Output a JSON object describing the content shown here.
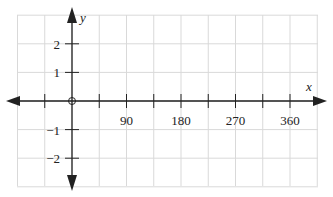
{
  "chart_data": {
    "type": "line",
    "title": "",
    "xlabel": "x",
    "ylabel": "y",
    "xlim": [
      -60,
      405
    ],
    "ylim": [
      -3,
      3
    ],
    "x_ticks": [
      90,
      180,
      270,
      360
    ],
    "x_tick_labels": [
      "90",
      "180",
      "270",
      "360"
    ],
    "y_ticks": [
      2,
      1,
      -1,
      -2
    ],
    "y_tick_labels": [
      "2",
      "1",
      "−1",
      "−2"
    ],
    "grid": true,
    "origin_marker": "open-circle",
    "series": []
  },
  "colors": {
    "axis": "#222222",
    "grid": "#d9d9d9",
    "background": "#ffffff"
  }
}
